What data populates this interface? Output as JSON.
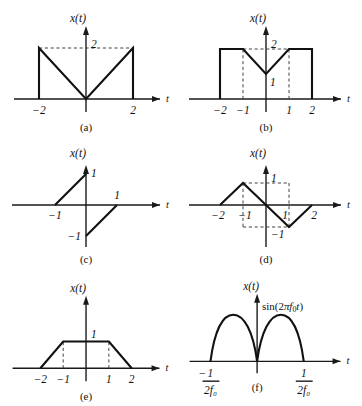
{
  "figure": {
    "background": "#ffffff",
    "stroke_color": "#111111",
    "dash_color": "#444444",
    "panels": [
      {
        "id": "a",
        "caption": "(a)",
        "y_axis_label": "x(t)",
        "x_axis_label": "t",
        "x_ticks": [
          {
            "label": "−2",
            "value": -2
          },
          {
            "label": "2",
            "value": 2
          }
        ],
        "y_ticks": [
          {
            "label": "2",
            "value": 2
          }
        ],
        "description": "Two back-to-back descending/ascending ramps forming a V, with vertical jumps to 2 at t=±2",
        "signal_points": [
          [
            -2,
            0
          ],
          [
            -2,
            2
          ],
          [
            0,
            0
          ],
          [
            2,
            2
          ],
          [
            2,
            0
          ]
        ],
        "dashed_guides": [
          {
            "from": [
              -2,
              2
            ],
            "to": [
              2,
              2
            ]
          }
        ]
      },
      {
        "id": "b",
        "caption": "(b)",
        "y_axis_label": "x(t)",
        "x_axis_label": "t",
        "x_ticks": [
          {
            "label": "−2",
            "value": -2
          },
          {
            "label": "−1",
            "value": -1
          },
          {
            "label": "1",
            "value": 1
          },
          {
            "label": "2",
            "value": 2
          }
        ],
        "y_ticks": [
          {
            "label": "2",
            "value": 2
          },
          {
            "label": "1",
            "value": 1
          }
        ],
        "description": "Flat at 2 from −2 to −1, V down to 1 at t=0, up to 2 at t=1, flat to t=2",
        "signal_points": [
          [
            -2,
            0
          ],
          [
            -2,
            2
          ],
          [
            -1,
            2
          ],
          [
            0,
            1
          ],
          [
            1,
            2
          ],
          [
            2,
            2
          ],
          [
            2,
            0
          ]
        ],
        "dashed_guides": [
          {
            "from": [
              -1,
              2
            ],
            "to": [
              1,
              2
            ]
          },
          {
            "from": [
              -1,
              0
            ],
            "to": [
              -1,
              2
            ]
          },
          {
            "from": [
              1,
              0
            ],
            "to": [
              1,
              2
            ]
          }
        ]
      },
      {
        "id": "c",
        "caption": "(c)",
        "y_axis_label": "x(t)",
        "x_axis_label": "t",
        "x_ticks": [
          {
            "label": "−1",
            "value": -1
          },
          {
            "label": "1",
            "value": 1
          }
        ],
        "y_ticks": [
          {
            "label": "1",
            "value": 1
          },
          {
            "label": "−1",
            "value": -1
          }
        ],
        "description": "Ramp from (−1,0) to (0,1); jump to (0,−1) then ramp to (1,0)",
        "signal_segments": [
          [
            [
              -1,
              0
            ],
            [
              0,
              1
            ]
          ],
          [
            [
              0,
              -1
            ],
            [
              1,
              0
            ]
          ]
        ],
        "dashed_guides": []
      },
      {
        "id": "d",
        "caption": "(d)",
        "y_axis_label": "x(t)",
        "x_axis_label": "t",
        "x_ticks": [
          {
            "label": "−2",
            "value": -2
          },
          {
            "label": "−1",
            "value": -1
          },
          {
            "label": "1",
            "value": 1
          },
          {
            "label": "2",
            "value": 2
          }
        ],
        "y_ticks": [
          {
            "label": "1",
            "value": 1
          },
          {
            "label": "−1",
            "value": -1
          }
        ],
        "description": "Triangular wave: up from (−2,0) to (−1,1), down through origin to (1,−1), up to (2,0)",
        "signal_points": [
          [
            -2,
            0
          ],
          [
            -1,
            1
          ],
          [
            0,
            0
          ],
          [
            1,
            -1
          ],
          [
            2,
            0
          ]
        ],
        "dashed_guides": [
          {
            "from": [
              -1,
              1
            ],
            "to": [
              1,
              1
            ]
          },
          {
            "from": [
              -1,
              1
            ],
            "to": [
              -1,
              -1
            ]
          },
          {
            "from": [
              1,
              1
            ],
            "to": [
              1,
              -1
            ]
          },
          {
            "from": [
              -1,
              -1
            ],
            "to": [
              1,
              -1
            ]
          }
        ]
      },
      {
        "id": "e",
        "caption": "(e)",
        "y_axis_label": "x(t)",
        "x_axis_label": "t",
        "x_ticks": [
          {
            "label": "−2",
            "value": -2
          },
          {
            "label": "−1",
            "value": -1
          },
          {
            "label": "1",
            "value": 1
          },
          {
            "label": "2",
            "value": 2
          }
        ],
        "y_ticks": [
          {
            "label": "1",
            "value": 1
          }
        ],
        "description": "Trapezoid rising from (−2,0) to (−1,1), flat to (1,1), falling to (2,0)",
        "signal_points": [
          [
            -2,
            0
          ],
          [
            -1,
            1
          ],
          [
            1,
            1
          ],
          [
            2,
            0
          ]
        ],
        "dashed_guides": [
          {
            "from": [
              -1,
              0
            ],
            "to": [
              -1,
              1
            ]
          },
          {
            "from": [
              1,
              0
            ],
            "to": [
              1,
              1
            ]
          }
        ]
      },
      {
        "id": "f",
        "caption": "(f)",
        "y_axis_label": "x(t)",
        "x_axis_label": "t",
        "expression": "sin (2πf₀t)",
        "expression_parts": {
          "sin": "sin",
          "open": "(2",
          "pi": "π",
          "f": "f",
          "sub": "0",
          "t": "t",
          "close": ")"
        },
        "x_ticks": [
          {
            "label_numerator": "1",
            "label_denominator": "2f₀",
            "sign": "−",
            "value": -0.5
          },
          {
            "label_numerator": "1",
            "label_denominator": "2f₀",
            "sign": "",
            "value": 0.5
          }
        ],
        "y_ticks": [],
        "description": "Full-wave rectified sine: two positive half-sine humps touching zero at t = 0 and t = ±1/(2f₀)",
        "dashed_guides": []
      }
    ]
  }
}
